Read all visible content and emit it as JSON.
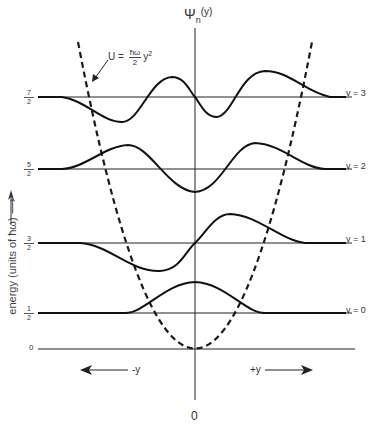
{
  "figure": {
    "title_axis_label": "Ψ",
    "title_axis_subscript": "n",
    "title_axis_arg": "(y)",
    "potential_label": {
      "lhs": "U =",
      "numerator": "ħω",
      "denominator": "2",
      "rhs": "y",
      "exponent": "2"
    },
    "y_axis_label": "energy (units of ħω) ⟶",
    "energy_levels": [
      {
        "v_label": "v = 3",
        "numerator": "7",
        "denominator": "2",
        "value": 3.5
      },
      {
        "v_label": "v = 2",
        "numerator": "5",
        "denominator": "2",
        "value": 2.5
      },
      {
        "v_label": "v = 1",
        "numerator": "3",
        "denominator": "2",
        "value": 1.5
      },
      {
        "v_label": "v = 0",
        "numerator": "1",
        "denominator": "2",
        "value": 0.5
      }
    ],
    "zero_label": "0",
    "neg_direction": "-y",
    "pos_direction": "+y",
    "origin_label": "0",
    "colors": {
      "line": "#1a1a1a",
      "background": "#ffffff"
    }
  }
}
